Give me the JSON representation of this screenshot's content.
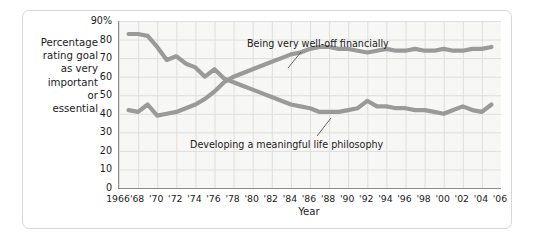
{
  "chart_data": {
    "type": "line",
    "title": "",
    "xlabel": "Year",
    "ylabel": "Percentage rating goal as very important or essential",
    "ylabel_lines": "Percentage\nrating goal\nas very\nimportant\nor\nessential",
    "xlim": [
      1966,
      2006
    ],
    "ylim": [
      0,
      90
    ],
    "grid": true,
    "legend_position": "inline-annotations",
    "yticks": [
      0,
      10,
      20,
      30,
      40,
      50,
      60,
      70,
      80,
      90
    ],
    "ytick_labels": [
      "0",
      "10",
      "20",
      "30",
      "40",
      "50",
      "60",
      "70",
      "80",
      "90%"
    ],
    "xticks": [
      1966,
      1968,
      1970,
      1972,
      1974,
      1976,
      1978,
      1980,
      1982,
      1984,
      1986,
      1988,
      1990,
      1992,
      1994,
      1996,
      1998,
      2000,
      2002,
      2004,
      2006
    ],
    "xtick_labels": [
      "1966",
      "'68",
      "'70",
      "'72",
      "'74",
      "'76",
      "'78",
      "'80",
      "'82",
      "'84",
      "'86",
      "'88",
      "'90",
      "'92",
      "'94",
      "'96",
      "'98",
      "'00",
      "'02",
      "'04",
      "'06"
    ],
    "line_color": "#9a9a9a",
    "x": [
      1967,
      1968,
      1969,
      1970,
      1971,
      1972,
      1973,
      1974,
      1975,
      1976,
      1977,
      1978,
      1979,
      1980,
      1981,
      1982,
      1983,
      1984,
      1985,
      1986,
      1987,
      1988,
      1989,
      1990,
      1991,
      1992,
      1993,
      1994,
      1995,
      1996,
      1997,
      1998,
      1999,
      2000,
      2001,
      2002,
      2003,
      2004,
      2005
    ],
    "series": [
      {
        "name": "Developing a meaningful life philosophy",
        "color": "#9a9a9a",
        "values": [
          83,
          83,
          82,
          76,
          69,
          71,
          67,
          65,
          60,
          64,
          59,
          57,
          55,
          53,
          51,
          49,
          47,
          45,
          44,
          43,
          41,
          41,
          41,
          42,
          43,
          47,
          44,
          44,
          43,
          43,
          42,
          42,
          41,
          40,
          42,
          44,
          42,
          41,
          45
        ]
      },
      {
        "name": "Being very well-off financially",
        "color": "#9a9a9a",
        "values": [
          42,
          41,
          45,
          39,
          40,
          41,
          43,
          45,
          48,
          52,
          57,
          60,
          62,
          64,
          66,
          68,
          70,
          72,
          73,
          75,
          76,
          76,
          75,
          75,
          74,
          73,
          74,
          75,
          74,
          74,
          75,
          74,
          74,
          75,
          74,
          74,
          75,
          75,
          76
        ]
      }
    ],
    "annotations": [
      {
        "name": "being-very-well-off-financially",
        "text": "Being very well-off financially",
        "text_x": 247,
        "text_y": 38,
        "leader": {
          "x1": 300,
          "y1": 52,
          "x2": 287,
          "y2": 68
        }
      },
      {
        "name": "developing-a-meaningful-life-philosophy",
        "text": "Developing a meaningful life philosophy",
        "text_x": 190,
        "text_y": 139,
        "leader": {
          "x1": 316,
          "y1": 136,
          "x2": 330,
          "y2": 118
        }
      }
    ]
  },
  "plot": {
    "background": "#f7f7f6",
    "grid_color": "#dededc",
    "axis_color": "#8d8d8d"
  }
}
